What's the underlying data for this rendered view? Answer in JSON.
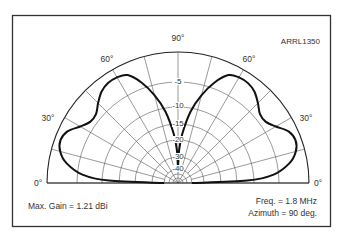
{
  "figure": {
    "id_label": "ARRL1350",
    "max_gain_text": "Max. Gain = 1.21 dBi",
    "freq_text": "Freq. = 1.8 MHz",
    "azimuth_text": "Azimuth = 90 deg."
  },
  "chart_data": {
    "type": "polar",
    "title": "",
    "subtitle": "Elevation pattern (half-plane)",
    "angle_unit": "deg",
    "angle_range": [
      0,
      180
    ],
    "angle_tick_labels": [
      "0°",
      "30°",
      "60°",
      "90°",
      "60°",
      "30°",
      "0°"
    ],
    "angle_ticks": [
      0,
      30,
      60,
      90,
      120,
      150,
      180
    ],
    "radial_axis": "Relative gain (dB)",
    "radial_tick_labels": [
      "-5",
      "-10",
      "-15",
      "-20",
      "-30",
      "-40"
    ],
    "radial_ticks_db": [
      0,
      -5,
      -10,
      -15,
      -20,
      -30,
      -40
    ],
    "grid": true,
    "max_gain_dbi": 1.21,
    "frequency_mhz": 1.8,
    "azimuth_deg": 90,
    "series": [
      {
        "name": "Elevation pattern",
        "elevation_deg": [
          0,
          2,
          5,
          10,
          15,
          20,
          25,
          30,
          35,
          40,
          45,
          50,
          55,
          60,
          65,
          70,
          75,
          80,
          85,
          88,
          90
        ],
        "relative_db": [
          -40,
          -12,
          -6,
          -3,
          -1.5,
          -1,
          -1.5,
          -3,
          -4,
          -4,
          -3,
          -2,
          -1.5,
          -1.5,
          -2,
          -4,
          -7,
          -11,
          -18,
          -26,
          -40
        ]
      }
    ]
  }
}
